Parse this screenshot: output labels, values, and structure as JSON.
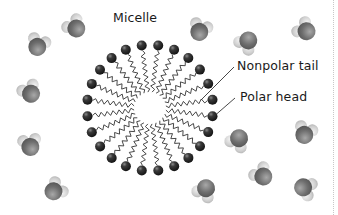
{
  "diagram": {
    "title": "Micelle",
    "labels": {
      "micelle": "Micelle",
      "nonpolar_tail": "Nonpolar tail",
      "polar_head": "Polar head"
    },
    "micelle": {
      "center": [
        150,
        108
      ],
      "head_radius": 63,
      "inner_radius": 16,
      "surfactant_count": 24,
      "head_color": "#2b2b2b",
      "tail_color": "#333333"
    },
    "water_molecules": [
      {
        "x": 38,
        "y": 45,
        "angle": 200
      },
      {
        "x": 75,
        "y": 27,
        "angle": 140
      },
      {
        "x": 30,
        "y": 92,
        "angle": 150
      },
      {
        "x": 30,
        "y": 145,
        "angle": 170
      },
      {
        "x": 55,
        "y": 190,
        "angle": 230
      },
      {
        "x": 200,
        "y": 30,
        "angle": 200
      },
      {
        "x": 247,
        "y": 42,
        "angle": 40
      },
      {
        "x": 305,
        "y": 30,
        "angle": 130
      },
      {
        "x": 238,
        "y": 140,
        "angle": 30
      },
      {
        "x": 305,
        "y": 133,
        "angle": 200
      },
      {
        "x": 262,
        "y": 175,
        "angle": 140
      },
      {
        "x": 205,
        "y": 190,
        "angle": 30
      },
      {
        "x": 305,
        "y": 188,
        "angle": 290
      }
    ],
    "colors": {
      "oxygen": "#7d7d7d",
      "hydrogen": "#d9d9d9",
      "text": "#1a1a1a",
      "leader_line": "#333333"
    }
  }
}
